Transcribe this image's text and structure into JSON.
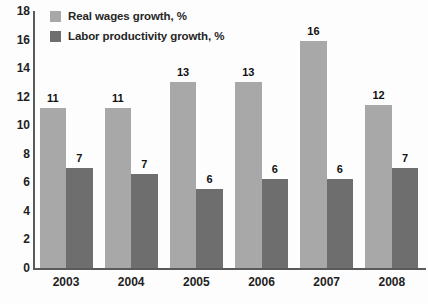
{
  "chart_data": {
    "type": "bar",
    "title": "",
    "xlabel": "",
    "ylabel": "",
    "ylim": [
      0,
      18
    ],
    "ytick_step": 2,
    "yticks": [
      18,
      16,
      14,
      12,
      10,
      8,
      6,
      4,
      2,
      0
    ],
    "grid": false,
    "legend_position": "top-left",
    "categories": [
      "2003",
      "2004",
      "2005",
      "2006",
      "2007",
      "2008"
    ],
    "series": [
      {
        "name": "Real wages growth, %",
        "color": "#a8a8a8",
        "values": [
          11.2,
          11.2,
          13.0,
          13.0,
          15.9,
          11.4
        ],
        "labels": [
          "11",
          "11",
          "13",
          "13",
          "16",
          "12"
        ]
      },
      {
        "name": "Labor productivity growth, %",
        "color": "#6e6e6e",
        "values": [
          7.0,
          6.6,
          5.5,
          6.2,
          6.2,
          7.0
        ],
        "labels": [
          "7",
          "7",
          "6",
          "6",
          "6",
          "7"
        ]
      }
    ]
  },
  "legend": {
    "items": [
      {
        "label": "Real wages growth, %",
        "color": "#a8a8a8"
      },
      {
        "label": "Labor productivity growth, %",
        "color": "#6e6e6e"
      }
    ]
  },
  "axis": {
    "color": "#5a5a5a"
  }
}
